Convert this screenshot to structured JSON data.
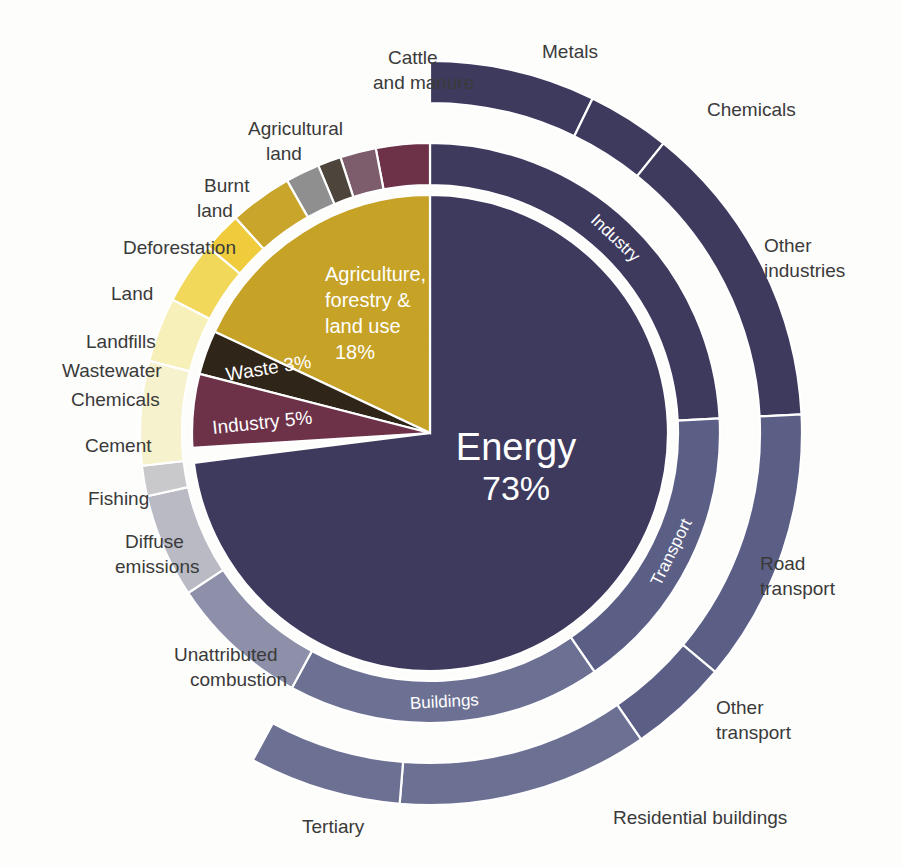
{
  "chart_data": {
    "type": "pie",
    "title": "",
    "subtitle": "",
    "layout": "sunburst / nested donut, 3 levels, starting at 12 o'clock, inner level clockwise for Energy and counter-clockwise for the rest",
    "center": {
      "cx": 430,
      "cy": 433
    },
    "radii": {
      "inner_circle": 238,
      "mid_inner": 248,
      "mid_outer": 290,
      "outer_inner": 330,
      "outer_outer": 372
    },
    "colors": {
      "energy": "#3d3a5e",
      "agriculture": "#c6a227",
      "industry": "#6d3148",
      "waste": "#2f2518",
      "cattle_and_manure": "#f6f2cd",
      "agricultural_land": "#f7f0b8",
      "burnt_land": "#f2d85a",
      "deforestation": "#f0cc3d",
      "land": "#c9a52c",
      "landfills": "#8f8f8f",
      "wastewater": "#4d443c",
      "chemicals": "#7d5c6b",
      "cement": "#6d3148",
      "fishing": "#c9c9cc",
      "diffuse_emissions": "#b9bac4",
      "unattributed_combustion": "#8d90a8",
      "tertiary": "#6c7193",
      "buildings": "#6c7193",
      "residential_buildings": "#6c7193",
      "other_transport": "#5b5f86",
      "road_transport": "#5b5f86",
      "transport": "#5b5f86",
      "other_industries": "#3d3a5e",
      "chemicals_industry": "#3d3a5e",
      "metals": "#3d3a5e"
    },
    "level1": [
      {
        "name": "Energy",
        "label": "Energy",
        "value_label": "73%",
        "value": 73,
        "color": "#3d3a5e"
      },
      {
        "name": "Agriculture, forestry & land use",
        "label": "Agriculture,\nforestry &\nland use",
        "value_label": "18%",
        "value": 18,
        "color": "#c6a227"
      },
      {
        "name": "Waste",
        "label": "Waste",
        "value_label": "3%",
        "value": 3,
        "color": "#2f2518"
      },
      {
        "name": "Industry",
        "label": "Industry",
        "value_label": "5%",
        "value": 5,
        "color": "#6d3148"
      }
    ],
    "level2": [
      {
        "name": "Industry",
        "label": "Industry",
        "value": 24.2,
        "color": "#3d3a5e",
        "parent": "Energy"
      },
      {
        "name": "Transport",
        "label": "Transport",
        "value": 16.2,
        "color": "#5b5f86",
        "parent": "Energy"
      },
      {
        "name": "Buildings",
        "label": "Buildings",
        "value": 17.5,
        "color": "#6c7193",
        "parent": "Energy"
      },
      {
        "name": "Unattributed combustion",
        "label": "Unattributed combustion",
        "value": 7.8,
        "color": "#8d90a8",
        "parent": "Energy"
      },
      {
        "name": "Diffuse emissions",
        "label": "Diffuse emissions",
        "value": 5.8,
        "color": "#b9bac4",
        "parent": "Energy"
      },
      {
        "name": "Fishing",
        "label": "Fishing",
        "value": 1.7,
        "color": "#c9c9cc",
        "parent": "Energy"
      },
      {
        "name": "Cement",
        "label": "Cement",
        "value": 3.0,
        "color": "#6d3148",
        "parent": "Industry"
      },
      {
        "name": "Chemicals",
        "label": "Chemicals",
        "value": 2.0,
        "color": "#7d5c6b",
        "parent": "Industry"
      },
      {
        "name": "Wastewater",
        "label": "Wastewater",
        "value": 1.3,
        "color": "#4d443c",
        "parent": "Waste"
      },
      {
        "name": "Landfills",
        "label": "Landfills",
        "value": 1.9,
        "color": "#8f8f8f",
        "parent": "Waste"
      },
      {
        "name": "Land",
        "label": "Land",
        "value": 3.5,
        "color": "#c9a52c",
        "parent": "Agriculture, forestry & land use"
      },
      {
        "name": "Deforestation",
        "label": "Deforestation",
        "value": 2.2,
        "color": "#f0cc3d",
        "parent": "Agriculture, forestry & land use"
      },
      {
        "name": "Burnt land",
        "label": "Burnt land",
        "value": 3.5,
        "color": "#f2d85a",
        "parent": "Agriculture, forestry & land use"
      },
      {
        "name": "Agricultural land",
        "label": "Agricultural land",
        "value": 3.6,
        "color": "#f7f0b8",
        "parent": "Agriculture, forestry & land use"
      },
      {
        "name": "Cattle and manure",
        "label": "Cattle and manure",
        "value": 5.8,
        "color": "#f6f2cd",
        "parent": "Agriculture, forestry & land use"
      }
    ],
    "level3": [
      {
        "name": "Metals",
        "label": "Metals",
        "value": 7.2,
        "color": "#3d3a5e",
        "parent": "Industry"
      },
      {
        "name": "Chemicals",
        "label": "Chemicals",
        "value": 3.6,
        "color": "#3d3a5e",
        "parent": "Industry"
      },
      {
        "name": "Other industries",
        "label": "Other industries",
        "value": 13.4,
        "color": "#3d3a5e",
        "parent": "Industry"
      },
      {
        "name": "Road transport",
        "label": "Road transport",
        "value": 11.9,
        "color": "#5b5f86",
        "parent": "Transport"
      },
      {
        "name": "Other transport",
        "label": "Other transport",
        "value": 4.3,
        "color": "#5b5f86",
        "parent": "Transport"
      },
      {
        "name": "Residential buildings",
        "label": "Residential buildings",
        "value": 10.9,
        "color": "#6c7193",
        "parent": "Buildings"
      },
      {
        "name": "Tertiary",
        "label": "Tertiary",
        "value": 6.6,
        "color": "#6c7193",
        "parent": "Buildings"
      }
    ],
    "outer_labels": [
      {
        "id": "metals",
        "text": "Metals",
        "x": 542,
        "y": 58
      },
      {
        "id": "chemicals-industry",
        "text": "Chemicals",
        "x": 707,
        "y": 116
      },
      {
        "id": "other-industries-1",
        "text": "Other",
        "x": 764,
        "y": 252
      },
      {
        "id": "other-industries-2",
        "text": "industries",
        "x": 764,
        "y": 277
      },
      {
        "id": "road-transport-1",
        "text": "Road",
        "x": 760,
        "y": 570
      },
      {
        "id": "road-transport-2",
        "text": "transport",
        "x": 760,
        "y": 595
      },
      {
        "id": "other-transport-1",
        "text": "Other",
        "x": 716,
        "y": 714
      },
      {
        "id": "other-transport-2",
        "text": "transport",
        "x": 716,
        "y": 739
      },
      {
        "id": "residential-buildings",
        "text": "Residential buildings",
        "x": 613,
        "y": 824
      },
      {
        "id": "tertiary",
        "text": "Tertiary",
        "x": 302,
        "y": 833
      },
      {
        "id": "unattributed-1",
        "text": "Unattributed",
        "x": 174,
        "y": 661
      },
      {
        "id": "unattributed-2",
        "text": "combustion",
        "x": 190,
        "y": 686
      },
      {
        "id": "diffuse-1",
        "text": "Diffuse",
        "x": 125,
        "y": 548
      },
      {
        "id": "diffuse-2",
        "text": "emissions",
        "x": 115,
        "y": 573
      },
      {
        "id": "fishing",
        "text": "Fishing",
        "x": 88,
        "y": 505
      },
      {
        "id": "cement",
        "text": "Cement",
        "x": 85,
        "y": 452
      },
      {
        "id": "chemicals-waste",
        "text": "Chemicals",
        "x": 71,
        "y": 406
      },
      {
        "id": "wastewater",
        "text": "Wastewater",
        "x": 62,
        "y": 377
      },
      {
        "id": "landfills",
        "text": "Landfills",
        "x": 86,
        "y": 348
      },
      {
        "id": "land",
        "text": "Land",
        "x": 111,
        "y": 300
      },
      {
        "id": "deforestation",
        "text": "Deforestation",
        "x": 123,
        "y": 254
      },
      {
        "id": "burnt-land-1",
        "text": "Burnt",
        "x": 204,
        "y": 192
      },
      {
        "id": "burnt-land-2",
        "text": "land",
        "x": 197,
        "y": 217
      },
      {
        "id": "agricultural-land-1",
        "text": "Agricultural",
        "x": 248,
        "y": 135
      },
      {
        "id": "agricultural-land-2",
        "text": "land",
        "x": 266,
        "y": 160
      },
      {
        "id": "cattle-1",
        "text": "Cattle",
        "x": 388,
        "y": 64
      },
      {
        "id": "cattle-2",
        "text": "and manure",
        "x": 373,
        "y": 89
      }
    ],
    "inner_ring_labels": [
      {
        "id": "buildings",
        "text": "Buildings"
      },
      {
        "id": "transport",
        "text": "Transport"
      },
      {
        "id": "industry",
        "text": "Industry"
      }
    ],
    "center_labels": {
      "energy_name": "Energy",
      "energy_value": "73%",
      "agriculture_line1": "Agriculture,",
      "agriculture_line2": "forestry &",
      "agriculture_line3": "land use",
      "agriculture_value": "18%",
      "waste": "Waste 3%",
      "industry": "Industry 5%"
    }
  }
}
